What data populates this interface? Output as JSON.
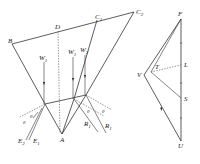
{
  "diagram": {
    "title": "",
    "left_figure": {
      "labels": {
        "B": "B",
        "D": "D",
        "C1": "C",
        "C1_sub": "1",
        "C2": "C",
        "C2_sub": "2",
        "A": "A",
        "W1": "W",
        "W1_sub": "1",
        "W2": "W",
        "W2_sub": "1",
        "W3": "W",
        "W3_sub": "2",
        "E1": "E",
        "E1_sub": "1",
        "E2": "E",
        "E2_sub": "2",
        "R1": "R",
        "R1_sub": "1",
        "R2": "R",
        "R2_sub": "1",
        "theta_left_1": "θ",
        "theta_left_2": "θ",
        "theta_right_1": "θ",
        "theta_right_2": "θ"
      }
    },
    "right_figure": {
      "labels": {
        "F": "F",
        "L": "L",
        "S": "S",
        "U": "U",
        "V": "V",
        "T": "T"
      }
    }
  }
}
